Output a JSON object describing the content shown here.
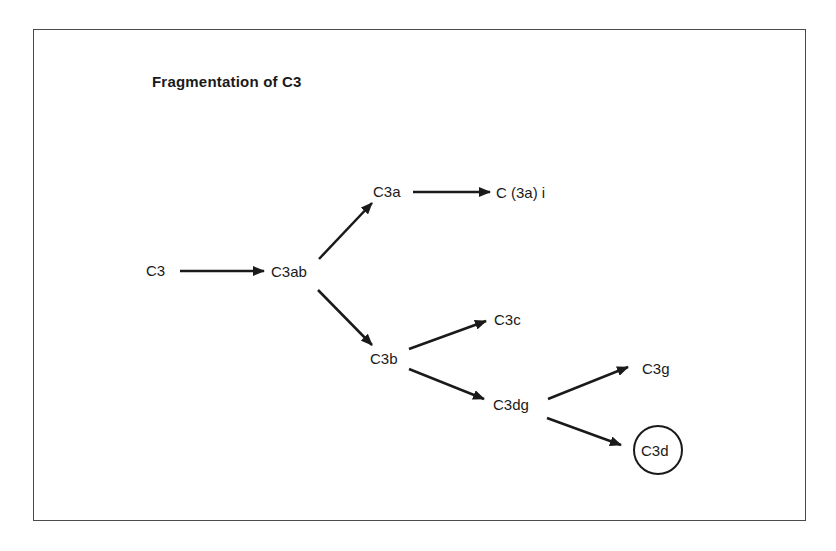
{
  "title": "Fragmentation of C3",
  "nodes": {
    "c3": "C3",
    "c3ab": "C3ab",
    "c3a": "C3a",
    "c3ai": "C (3a) i",
    "c3b": "C3b",
    "c3c": "C3c",
    "c3dg": "C3dg",
    "c3g": "C3g",
    "c3d": "C3d"
  },
  "edges": [
    {
      "from": "C3",
      "to": "C3ab"
    },
    {
      "from": "C3ab",
      "to": "C3a"
    },
    {
      "from": "C3ab",
      "to": "C3b"
    },
    {
      "from": "C3a",
      "to": "C (3a) i"
    },
    {
      "from": "C3b",
      "to": "C3c"
    },
    {
      "from": "C3b",
      "to": "C3dg"
    },
    {
      "from": "C3dg",
      "to": "C3g"
    },
    {
      "from": "C3dg",
      "to": "C3d"
    }
  ],
  "highlighted_node": "C3d",
  "colors": {
    "line": "#1a1a1a",
    "frame": "#4a4a4a",
    "background": "#ffffff"
  }
}
